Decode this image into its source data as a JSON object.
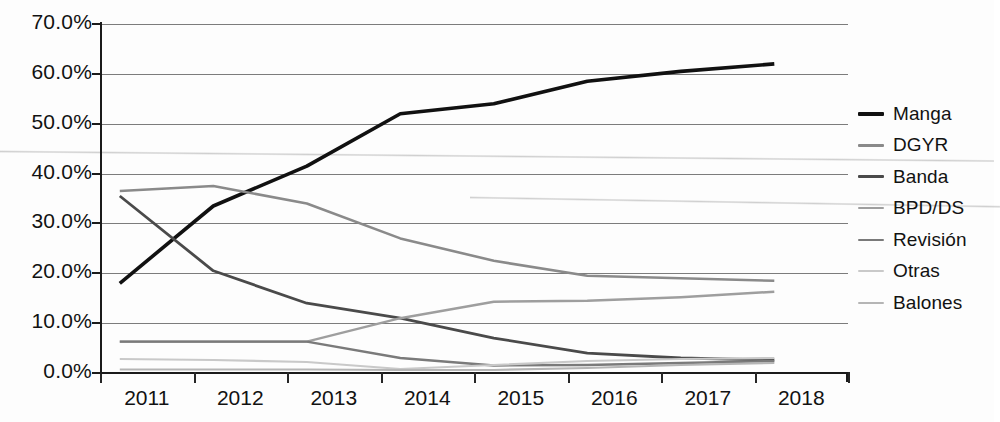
{
  "chart_data": {
    "type": "line",
    "title": "",
    "xlabel": "",
    "ylabel": "",
    "categories": [
      "2011",
      "2012",
      "2013",
      "2014",
      "2015",
      "2016",
      "2017",
      "2018"
    ],
    "ylim": [
      0,
      70
    ],
    "ytick_labels": [
      "0.0%",
      "10.0%",
      "20.0%",
      "30.0%",
      "40.0%",
      "50.0%",
      "60.0%",
      "70.0%"
    ],
    "ytick_values": [
      0,
      10,
      20,
      30,
      40,
      50,
      60,
      70
    ],
    "grid": true,
    "legend_position": "right",
    "series": [
      {
        "name": "Manga",
        "color": "#111111",
        "width": 3.6,
        "values": [
          18.0,
          33.5,
          41.5,
          52.0,
          54.0,
          58.5,
          60.5,
          62.0
        ]
      },
      {
        "name": "DGYR",
        "color": "#8a8a8a",
        "width": 2.6,
        "values": [
          36.5,
          37.5,
          34.0,
          27.0,
          22.5,
          19.5,
          19.0,
          18.5
        ]
      },
      {
        "name": "Banda",
        "color": "#4a4a4a",
        "width": 2.8,
        "values": [
          35.5,
          20.5,
          14.0,
          11.0,
          7.0,
          4.0,
          3.0,
          2.6
        ]
      },
      {
        "name": "BPD/DS",
        "color": "#9e9e9e",
        "width": 2.4,
        "values": [
          6.3,
          6.3,
          6.3,
          11.0,
          14.3,
          14.5,
          15.2,
          16.3
        ]
      },
      {
        "name": "Revisión",
        "color": "#7a7a7a",
        "width": 2.4,
        "values": [
          6.3,
          6.3,
          6.3,
          3.0,
          1.5,
          1.6,
          2.0,
          2.4
        ]
      },
      {
        "name": "Otras",
        "color": "#c9c9c9",
        "width": 2.2,
        "values": [
          2.8,
          2.6,
          2.2,
          0.8,
          1.6,
          2.4,
          2.8,
          3.0
        ]
      },
      {
        "name": "Balones",
        "color": "#b5b5b5",
        "width": 2.2,
        "values": [
          0.7,
          0.7,
          0.7,
          0.6,
          0.6,
          1.0,
          1.6,
          2.0
        ]
      }
    ]
  }
}
